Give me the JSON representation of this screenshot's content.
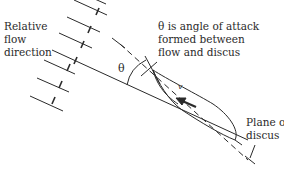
{
  "diagram": {
    "labels": {
      "flow_direction": [
        "Relative",
        "flow",
        "direction"
      ],
      "angle_description": [
        "θ is angle of attack",
        "formed between",
        "flow and discus"
      ],
      "plane": [
        "Plane of",
        "discus"
      ],
      "theta_symbol": "θ",
      "velocity_symbol": "v"
    },
    "colors": {
      "ink": "#2a2a2a",
      "background": "#ffffff"
    },
    "elements": {
      "flow_lines": 7,
      "discus": "lens-shaped cross-section tilted at angle of attack",
      "arrow": "velocity arrow pointing up-left inside discus"
    }
  }
}
